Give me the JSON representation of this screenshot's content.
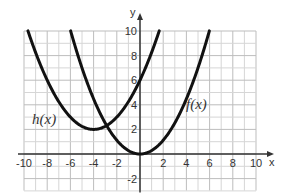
{
  "chart_data": {
    "type": "line",
    "title": "",
    "xlabel": "x",
    "ylabel": "y",
    "xlim": [
      -10,
      10
    ],
    "ylim": [
      -2,
      10
    ],
    "grid": true,
    "x_ticks": [
      -10,
      -8,
      -6,
      -4,
      -2,
      2,
      4,
      6,
      8,
      10
    ],
    "x_tick_labels": [
      "-10",
      "-8",
      "-6",
      "-4",
      "-2",
      "2",
      "4",
      "6",
      "8",
      "10"
    ],
    "y_ticks": [
      -2,
      2,
      4,
      6,
      8,
      10
    ],
    "y_tick_labels": [
      "-2",
      "2",
      "4",
      "6",
      "8",
      "10"
    ],
    "series": [
      {
        "name": "f(x)",
        "label": "f(x)",
        "equation": "approx. 0.28x^2",
        "vertex": [
          0,
          0
        ],
        "x": [
          -6,
          -4,
          -2,
          0,
          2,
          4,
          6
        ],
        "y": [
          10,
          4.5,
          1.1,
          0,
          1.1,
          4.5,
          10
        ]
      },
      {
        "name": "h(x)",
        "label": "h(x)",
        "equation": "approx. 0.25(x+4)^2 + 2",
        "vertex": [
          -4,
          2
        ],
        "x": [
          -9.7,
          -8,
          -6,
          -4,
          -2,
          0,
          1.7
        ],
        "y": [
          10,
          6,
          3,
          2,
          3,
          6,
          10
        ]
      }
    ],
    "labels": {
      "h": "h(x)",
      "f": "f(x)",
      "x_axis": "x",
      "y_axis": "y"
    }
  }
}
